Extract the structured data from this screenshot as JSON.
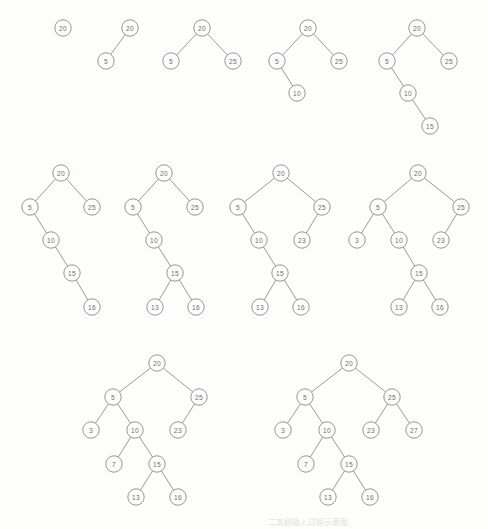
{
  "figure": {
    "node_radius": 8.2,
    "colors": {
      "background": "#fdfdfb",
      "stroke": "#8a8a8a",
      "edge": "#8e8e8e",
      "label": "#6f6f6f",
      "bleed": "#e2e0dc"
    },
    "insertion_sequence": [
      20,
      5,
      25,
      10,
      15,
      16,
      13,
      23,
      3,
      7,
      27
    ],
    "bleed_through_text": "二叉树插入过程示意图"
  },
  "chart_data": {
    "type": "diagram",
    "steps": 11,
    "trees": [
      {
        "index": 1,
        "inserted": 20,
        "nodes": [
          {
            "value": "20",
            "x": 63,
            "y": 28
          }
        ],
        "edges": []
      },
      {
        "index": 2,
        "inserted": 5,
        "nodes": [
          {
            "value": "20",
            "x": 130,
            "y": 28
          },
          {
            "value": "5",
            "x": 106,
            "y": 61
          }
        ],
        "edges": [
          {
            "x1": 130,
            "y1": 28,
            "x2": 106,
            "y2": 61
          }
        ]
      },
      {
        "index": 3,
        "inserted": 25,
        "nodes": [
          {
            "value": "20",
            "x": 202,
            "y": 28
          },
          {
            "value": "5",
            "x": 171,
            "y": 61
          },
          {
            "value": "25",
            "x": 233,
            "y": 61
          }
        ],
        "edges": [
          {
            "x1": 202,
            "y1": 28,
            "x2": 171,
            "y2": 61
          },
          {
            "x1": 202,
            "y1": 28,
            "x2": 233,
            "y2": 61
          }
        ]
      },
      {
        "index": 4,
        "inserted": 10,
        "nodes": [
          {
            "value": "20",
            "x": 308,
            "y": 28
          },
          {
            "value": "5",
            "x": 277,
            "y": 61
          },
          {
            "value": "25",
            "x": 339,
            "y": 61
          },
          {
            "value": "10",
            "x": 297,
            "y": 93
          }
        ],
        "edges": [
          {
            "x1": 308,
            "y1": 28,
            "x2": 277,
            "y2": 61
          },
          {
            "x1": 308,
            "y1": 28,
            "x2": 339,
            "y2": 61
          },
          {
            "x1": 277,
            "y1": 61,
            "x2": 297,
            "y2": 93
          }
        ]
      },
      {
        "index": 5,
        "inserted": 15,
        "nodes": [
          {
            "value": "20",
            "x": 417,
            "y": 28
          },
          {
            "value": "5",
            "x": 387,
            "y": 61
          },
          {
            "value": "25",
            "x": 449,
            "y": 61
          },
          {
            "value": "10",
            "x": 408,
            "y": 93
          },
          {
            "value": "15",
            "x": 430,
            "y": 126
          }
        ],
        "edges": [
          {
            "x1": 417,
            "y1": 28,
            "x2": 387,
            "y2": 61
          },
          {
            "x1": 417,
            "y1": 28,
            "x2": 449,
            "y2": 61
          },
          {
            "x1": 387,
            "y1": 61,
            "x2": 408,
            "y2": 93
          },
          {
            "x1": 408,
            "y1": 93,
            "x2": 430,
            "y2": 126
          }
        ]
      },
      {
        "index": 6,
        "inserted": 16,
        "nodes": [
          {
            "value": "20",
            "x": 61,
            "y": 173
          },
          {
            "value": "5",
            "x": 30,
            "y": 207
          },
          {
            "value": "25",
            "x": 92,
            "y": 207
          },
          {
            "value": "10",
            "x": 51,
            "y": 240
          },
          {
            "value": "15",
            "x": 72,
            "y": 273
          },
          {
            "value": "16",
            "x": 92,
            "y": 307
          }
        ],
        "edges": [
          {
            "x1": 61,
            "y1": 173,
            "x2": 30,
            "y2": 207
          },
          {
            "x1": 61,
            "y1": 173,
            "x2": 92,
            "y2": 207
          },
          {
            "x1": 30,
            "y1": 207,
            "x2": 51,
            "y2": 240
          },
          {
            "x1": 51,
            "y1": 240,
            "x2": 72,
            "y2": 273
          },
          {
            "x1": 72,
            "y1": 273,
            "x2": 92,
            "y2": 307
          }
        ]
      },
      {
        "index": 7,
        "inserted": 13,
        "nodes": [
          {
            "value": "20",
            "x": 164,
            "y": 173
          },
          {
            "value": "5",
            "x": 133,
            "y": 207
          },
          {
            "value": "25",
            "x": 195,
            "y": 207
          },
          {
            "value": "10",
            "x": 154,
            "y": 240
          },
          {
            "value": "15",
            "x": 175,
            "y": 273
          },
          {
            "value": "13",
            "x": 155,
            "y": 307
          },
          {
            "value": "16",
            "x": 196,
            "y": 307
          }
        ],
        "edges": [
          {
            "x1": 164,
            "y1": 173,
            "x2": 133,
            "y2": 207
          },
          {
            "x1": 164,
            "y1": 173,
            "x2": 195,
            "y2": 207
          },
          {
            "x1": 133,
            "y1": 207,
            "x2": 154,
            "y2": 240
          },
          {
            "x1": 154,
            "y1": 240,
            "x2": 175,
            "y2": 273
          },
          {
            "x1": 175,
            "y1": 273,
            "x2": 155,
            "y2": 307
          },
          {
            "x1": 175,
            "y1": 273,
            "x2": 196,
            "y2": 307
          }
        ]
      },
      {
        "index": 8,
        "inserted": 23,
        "nodes": [
          {
            "value": "20",
            "x": 281,
            "y": 173
          },
          {
            "value": "5",
            "x": 238,
            "y": 207
          },
          {
            "value": "25",
            "x": 322,
            "y": 207
          },
          {
            "value": "10",
            "x": 259,
            "y": 240
          },
          {
            "value": "23",
            "x": 302,
            "y": 240
          },
          {
            "value": "15",
            "x": 280,
            "y": 273
          },
          {
            "value": "13",
            "x": 260,
            "y": 307
          },
          {
            "value": "16",
            "x": 301,
            "y": 307
          }
        ],
        "edges": [
          {
            "x1": 281,
            "y1": 173,
            "x2": 238,
            "y2": 207
          },
          {
            "x1": 281,
            "y1": 173,
            "x2": 322,
            "y2": 207
          },
          {
            "x1": 238,
            "y1": 207,
            "x2": 259,
            "y2": 240
          },
          {
            "x1": 322,
            "y1": 207,
            "x2": 302,
            "y2": 240
          },
          {
            "x1": 259,
            "y1": 240,
            "x2": 280,
            "y2": 273
          },
          {
            "x1": 280,
            "y1": 273,
            "x2": 260,
            "y2": 307
          },
          {
            "x1": 280,
            "y1": 273,
            "x2": 301,
            "y2": 307
          }
        ]
      },
      {
        "index": 9,
        "inserted": 3,
        "nodes": [
          {
            "value": "20",
            "x": 418,
            "y": 173
          },
          {
            "value": "5",
            "x": 378,
            "y": 207
          },
          {
            "value": "25",
            "x": 461,
            "y": 207
          },
          {
            "value": "3",
            "x": 357,
            "y": 240
          },
          {
            "value": "10",
            "x": 399,
            "y": 240
          },
          {
            "value": "23",
            "x": 441,
            "y": 240
          },
          {
            "value": "15",
            "x": 419,
            "y": 273
          },
          {
            "value": "13",
            "x": 399,
            "y": 307
          },
          {
            "value": "16",
            "x": 440,
            "y": 307
          }
        ],
        "edges": [
          {
            "x1": 418,
            "y1": 173,
            "x2": 378,
            "y2": 207
          },
          {
            "x1": 418,
            "y1": 173,
            "x2": 461,
            "y2": 207
          },
          {
            "x1": 378,
            "y1": 207,
            "x2": 357,
            "y2": 240
          },
          {
            "x1": 378,
            "y1": 207,
            "x2": 399,
            "y2": 240
          },
          {
            "x1": 461,
            "y1": 207,
            "x2": 441,
            "y2": 240
          },
          {
            "x1": 399,
            "y1": 240,
            "x2": 419,
            "y2": 273
          },
          {
            "x1": 419,
            "y1": 273,
            "x2": 399,
            "y2": 307
          },
          {
            "x1": 419,
            "y1": 273,
            "x2": 440,
            "y2": 307
          }
        ]
      },
      {
        "index": 10,
        "inserted": 7,
        "nodes": [
          {
            "value": "20",
            "x": 157,
            "y": 363
          },
          {
            "value": "5",
            "x": 113,
            "y": 397
          },
          {
            "value": "25",
            "x": 199,
            "y": 397
          },
          {
            "value": "3",
            "x": 91,
            "y": 430
          },
          {
            "value": "10",
            "x": 135,
            "y": 430
          },
          {
            "value": "23",
            "x": 178,
            "y": 430
          },
          {
            "value": "7",
            "x": 114,
            "y": 464
          },
          {
            "value": "15",
            "x": 157,
            "y": 464
          },
          {
            "value": "13",
            "x": 136,
            "y": 497
          },
          {
            "value": "16",
            "x": 178,
            "y": 497
          }
        ],
        "edges": [
          {
            "x1": 157,
            "y1": 363,
            "x2": 113,
            "y2": 397
          },
          {
            "x1": 157,
            "y1": 363,
            "x2": 199,
            "y2": 397
          },
          {
            "x1": 113,
            "y1": 397,
            "x2": 91,
            "y2": 430
          },
          {
            "x1": 113,
            "y1": 397,
            "x2": 135,
            "y2": 430
          },
          {
            "x1": 199,
            "y1": 397,
            "x2": 178,
            "y2": 430
          },
          {
            "x1": 135,
            "y1": 430,
            "x2": 114,
            "y2": 464
          },
          {
            "x1": 135,
            "y1": 430,
            "x2": 157,
            "y2": 464
          },
          {
            "x1": 157,
            "y1": 464,
            "x2": 136,
            "y2": 497
          },
          {
            "x1": 157,
            "y1": 464,
            "x2": 178,
            "y2": 497
          }
        ]
      },
      {
        "index": 11,
        "inserted": 27,
        "nodes": [
          {
            "value": "20",
            "x": 349,
            "y": 363
          },
          {
            "value": "5",
            "x": 305,
            "y": 397
          },
          {
            "value": "25",
            "x": 392,
            "y": 397
          },
          {
            "value": "3",
            "x": 283,
            "y": 430
          },
          {
            "value": "10",
            "x": 327,
            "y": 430
          },
          {
            "value": "23",
            "x": 371,
            "y": 430
          },
          {
            "value": "27",
            "x": 414,
            "y": 430
          },
          {
            "value": "7",
            "x": 306,
            "y": 464
          },
          {
            "value": "15",
            "x": 349,
            "y": 464
          },
          {
            "value": "13",
            "x": 328,
            "y": 497
          },
          {
            "value": "16",
            "x": 370,
            "y": 497
          }
        ],
        "edges": [
          {
            "x1": 349,
            "y1": 363,
            "x2": 305,
            "y2": 397
          },
          {
            "x1": 349,
            "y1": 363,
            "x2": 392,
            "y2": 397
          },
          {
            "x1": 305,
            "y1": 397,
            "x2": 283,
            "y2": 430
          },
          {
            "x1": 305,
            "y1": 397,
            "x2": 327,
            "y2": 430
          },
          {
            "x1": 392,
            "y1": 397,
            "x2": 371,
            "y2": 430
          },
          {
            "x1": 392,
            "y1": 397,
            "x2": 414,
            "y2": 430
          },
          {
            "x1": 327,
            "y1": 430,
            "x2": 306,
            "y2": 464
          },
          {
            "x1": 327,
            "y1": 430,
            "x2": 349,
            "y2": 464
          },
          {
            "x1": 349,
            "y1": 464,
            "x2": 328,
            "y2": 497
          },
          {
            "x1": 349,
            "y1": 464,
            "x2": 370,
            "y2": 497
          }
        ]
      }
    ]
  }
}
